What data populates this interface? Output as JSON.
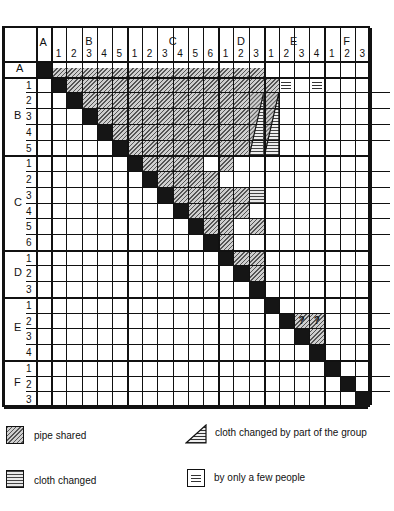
{
  "chart_data": {
    "type": "matrix",
    "title": "",
    "groups": [
      {
        "name": "A",
        "items": [
          ""
        ]
      },
      {
        "name": "B",
        "items": [
          "1",
          "2",
          "3",
          "4",
          "5"
        ]
      },
      {
        "name": "C",
        "items": [
          "1",
          "2",
          "3",
          "4",
          "5",
          "6"
        ]
      },
      {
        "name": "D",
        "items": [
          "1",
          "2",
          "3"
        ]
      },
      {
        "name": "E",
        "items": [
          "1",
          "2",
          "3",
          "4"
        ]
      },
      {
        "name": "F",
        "items": [
          "1",
          "2",
          "3"
        ]
      }
    ],
    "diagonal": "black",
    "cells": [
      {
        "row": 0,
        "cols": [
          1,
          2,
          3,
          4,
          5,
          6,
          7,
          8,
          9,
          10,
          11,
          12,
          13,
          14
        ],
        "type": "half"
      },
      {
        "row": 1,
        "cols": [
          2,
          3,
          4,
          5,
          6,
          7,
          8,
          9,
          10,
          11,
          12,
          13,
          14,
          15
        ],
        "type": "hatch"
      },
      {
        "row": 1,
        "cols": [
          16,
          18
        ],
        "type": "few"
      },
      {
        "row": 2,
        "cols": [
          3,
          4,
          5,
          6,
          7,
          8,
          9,
          10,
          11,
          12,
          13
        ],
        "type": "hatch"
      },
      {
        "row": 3,
        "cols": [
          4,
          5,
          6,
          7,
          8,
          9,
          10,
          11,
          12,
          13
        ],
        "type": "hatch"
      },
      {
        "row": 4,
        "cols": [
          5,
          6,
          7,
          8,
          9,
          10,
          11,
          12,
          13
        ],
        "type": "hatch"
      },
      {
        "row": 5,
        "cols": [
          6,
          7,
          8,
          9,
          10,
          11,
          12,
          13
        ],
        "type": "hatch"
      },
      {
        "row": 6,
        "cols": [
          7,
          8,
          9,
          10,
          12
        ],
        "type": "hatch"
      },
      {
        "row": 7,
        "cols": [
          8,
          9,
          10,
          11
        ],
        "type": "hatch"
      },
      {
        "row": 8,
        "cols": [
          9,
          10,
          11,
          12,
          13
        ],
        "type": "hatch"
      },
      {
        "row": 8,
        "cols": [
          14
        ],
        "type": "stripe"
      },
      {
        "row": 9,
        "cols": [
          10,
          11,
          12,
          13
        ],
        "type": "hatch"
      },
      {
        "row": 10,
        "cols": [
          11,
          12,
          14
        ],
        "type": "hatch"
      },
      {
        "row": 11,
        "cols": [
          12
        ],
        "type": "hatch"
      },
      {
        "row": 12,
        "cols": [
          13,
          14
        ],
        "type": "hatch"
      },
      {
        "row": 13,
        "cols": [
          14
        ],
        "type": "hatch"
      },
      {
        "row": 16,
        "cols": [
          17,
          18
        ],
        "type": "hatch-question"
      },
      {
        "row": 17,
        "cols": [
          18
        ],
        "type": "hatch"
      }
    ],
    "partial_group_wedges": [
      {
        "rows": [
          2,
          5
        ],
        "col": 14
      },
      {
        "rows": [
          2,
          5
        ],
        "col": 15
      }
    ],
    "legend": [
      {
        "key": "pipe_shared",
        "label": "pipe shared"
      },
      {
        "key": "cloth_changed_part",
        "label": "cloth changed by part of the group"
      },
      {
        "key": "cloth_changed",
        "label": "cloth changed"
      },
      {
        "key": "few_people",
        "label": "by only a few people"
      }
    ]
  },
  "question_mark": "?"
}
